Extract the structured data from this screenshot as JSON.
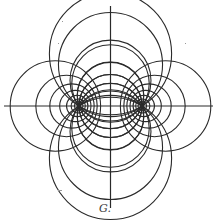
{
  "figure": {
    "caption": "G.",
    "ink_color": "#2a2a2a",
    "paper_color": "#ffffff",
    "poles": [
      {
        "name": "left-pole",
        "x": -1,
        "y": 0
      },
      {
        "name": "right-pole",
        "x": 1,
        "y": 0
      }
    ],
    "apollonian_circle_params_tau": [
      0.65,
      0.9,
      1.15,
      1.45,
      1.8,
      2.2,
      2.7
    ],
    "pole_circle_params_sigma": [
      0.65,
      0.95,
      1.25,
      1.57,
      1.9,
      2.25,
      2.6
    ],
    "axes": [
      "horizontal-axis",
      "vertical-axis"
    ]
  }
}
